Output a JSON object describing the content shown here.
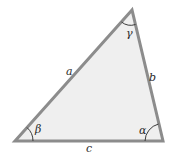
{
  "diagram": {
    "type": "triangle",
    "colors": {
      "fill": "#efefef",
      "stroke": "#8c8c8c",
      "arc": "#3a3a3a",
      "text": "#2a2a2a"
    },
    "vertices": {
      "top": [
        132,
        10
      ],
      "bottom_left": [
        15,
        141
      ],
      "bottom_right": [
        163,
        141
      ]
    },
    "sides": [
      {
        "name": "a",
        "label": "a",
        "between": "bottom_left-top"
      },
      {
        "name": "b",
        "label": "b",
        "between": "top-bottom_right"
      },
      {
        "name": "c",
        "label": "c",
        "between": "bottom_left-bottom_right"
      }
    ],
    "angles": [
      {
        "name": "gamma",
        "label": "γ",
        "vertex": "top"
      },
      {
        "name": "beta",
        "label": "β",
        "vertex": "bottom_left"
      },
      {
        "name": "alpha",
        "label": "α",
        "vertex": "bottom_right"
      }
    ]
  },
  "labels": {
    "side_a": "a",
    "side_b": "b",
    "side_c": "c",
    "angle_gamma": "γ",
    "angle_beta": "β",
    "angle_alpha": "α"
  }
}
